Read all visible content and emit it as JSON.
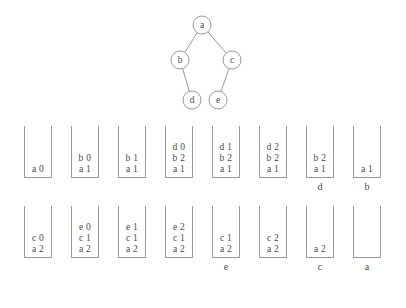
{
  "figure": {
    "tree": {
      "nodes": [
        {
          "id": "a",
          "label": "a",
          "cx": 52,
          "cy": 17
        },
        {
          "id": "b",
          "label": "b",
          "cx": 30,
          "cy": 52
        },
        {
          "id": "c",
          "label": "c",
          "cx": 82,
          "cy": 52
        },
        {
          "id": "d",
          "label": "d",
          "cx": 42,
          "cy": 92
        },
        {
          "id": "e",
          "label": "e",
          "cx": 68,
          "cy": 92
        }
      ],
      "edges": [
        {
          "from": "a",
          "to": "b"
        },
        {
          "from": "a",
          "to": "c"
        },
        {
          "from": "b",
          "to": "d"
        },
        {
          "from": "c",
          "to": "e"
        }
      ],
      "node_radius": 9,
      "stroke_color": "#8e8e8e"
    },
    "rows": [
      {
        "id": "row-1",
        "stacks": [
          {
            "frames": [
              "a 0"
            ],
            "caption": ""
          },
          {
            "frames": [
              "b 0",
              "a 1"
            ],
            "caption": ""
          },
          {
            "frames": [
              "b 1",
              "a 1"
            ],
            "caption": ""
          },
          {
            "frames": [
              "d 0",
              "b 2",
              "a 1"
            ],
            "caption": ""
          },
          {
            "frames": [
              "d 1",
              "b 2",
              "a 1"
            ],
            "caption": ""
          },
          {
            "frames": [
              "d 2",
              "b 2",
              "a 1"
            ],
            "caption": ""
          },
          {
            "frames": [
              "b 2",
              "a 1"
            ],
            "caption": "d"
          },
          {
            "frames": [
              "a 1"
            ],
            "caption": "b"
          }
        ]
      },
      {
        "id": "row-2",
        "stacks": [
          {
            "frames": [
              "c 0",
              "a 2"
            ],
            "caption": ""
          },
          {
            "frames": [
              "e 0",
              "c 1",
              "a 2"
            ],
            "caption": ""
          },
          {
            "frames": [
              "e 1",
              "c 1",
              "a 2"
            ],
            "caption": ""
          },
          {
            "frames": [
              "e 2",
              "c 1",
              "a 2"
            ],
            "caption": ""
          },
          {
            "frames": [
              "c 1",
              "a 2"
            ],
            "caption": "e"
          },
          {
            "frames": [
              "c 2",
              "a 2"
            ],
            "caption": ""
          },
          {
            "frames": [
              "a 2"
            ],
            "caption": "c"
          },
          {
            "frames": [],
            "caption": "a"
          }
        ]
      }
    ]
  }
}
